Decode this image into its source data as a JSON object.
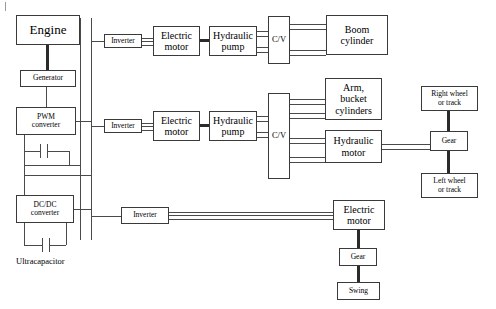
{
  "diagram": {
    "type": "block-diagram",
    "line_color": "#4a4a4a",
    "shaft_color": "#2b2b2b",
    "background": "#ffffff"
  },
  "blocks": {
    "engine": "Engine",
    "generator": "Generator",
    "pwm_converter_l1": "PWM",
    "pwm_converter_l2": "converter",
    "dcdc_converter_l1": "DC/DC",
    "dcdc_converter_l2": "converter",
    "ultracapacitor": "Ultracapacitor",
    "inverter_1": "Inverter",
    "inverter_2": "Inverter",
    "inverter_3": "Inverter",
    "electric_motor_1_l1": "Electric",
    "electric_motor_1_l2": "motor",
    "electric_motor_2_l1": "Electric",
    "electric_motor_2_l2": "motor",
    "electric_motor_3_l1": "Electric",
    "electric_motor_3_l2": "motor",
    "hydraulic_pump_1_l1": "Hydraulic",
    "hydraulic_pump_1_l2": "pump",
    "hydraulic_pump_2_l1": "Hydraulic",
    "hydraulic_pump_2_l2": "pump",
    "cv_1": "C/V",
    "cv_2": "C/V",
    "boom_cylinder_l1": "Boom",
    "boom_cylinder_l2": "cylinder",
    "arm_bucket_l1": "Arm,",
    "arm_bucket_l2": "bucket",
    "arm_bucket_l3": "cylinders",
    "hydraulic_motor_l1": "Hydraulic",
    "hydraulic_motor_l2": "motor",
    "right_wheel_l1": "Right wheel",
    "right_wheel_l2": "or track",
    "left_wheel_l1": "Left wheel",
    "left_wheel_l2": "or track",
    "gear_travel": "Gear",
    "gear_swing": "Gear",
    "swing": "Swing"
  }
}
